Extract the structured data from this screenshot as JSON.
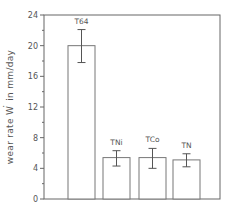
{
  "chart_data": {
    "type": "bar",
    "title": "",
    "xlabel": "",
    "ylabel": "wear rate W in mm/day",
    "ylabel_parts": {
      "prefix": "wear rate W",
      "dot_symbol": "·",
      "suffix": "in   mm/day"
    },
    "ylim": [
      0,
      24
    ],
    "yticks": [
      0,
      4,
      8,
      12,
      16,
      20,
      24
    ],
    "y_minor_step": 2,
    "grid": false,
    "legend": null,
    "categories": [
      "T64",
      "TNi",
      "TCo",
      "TN"
    ],
    "values": [
      20.0,
      5.4,
      5.4,
      5.1
    ],
    "error_low": [
      17.8,
      4.3,
      4.0,
      4.2
    ],
    "error_high": [
      22.1,
      6.3,
      6.6,
      5.9
    ],
    "colors": {
      "bar_fill": "#ffffff",
      "bar_stroke": "#777777",
      "axis": "#666666",
      "text": "#555555"
    }
  }
}
